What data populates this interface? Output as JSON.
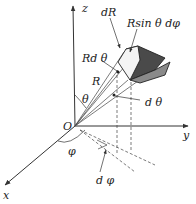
{
  "figure": {
    "axes": {
      "z_label": "z",
      "y_label": "y",
      "x_label": "x",
      "origin_label": "O"
    },
    "annotations": {
      "dR": "dR",
      "R_sin_theta_dphi": "Rsin θ dφ",
      "R_dtheta": "Rd θ",
      "R": "R",
      "theta": "θ",
      "dtheta": "d θ",
      "phi": "φ",
      "dphi": "d φ"
    },
    "colors": {
      "line": "#333333",
      "box_dark": "#4a4a4a",
      "box_mid": "#8a8a8a",
      "box_light": "#f4f4f4"
    }
  }
}
